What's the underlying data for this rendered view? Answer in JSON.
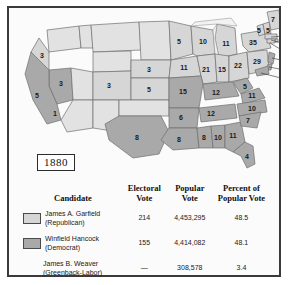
{
  "figure": {
    "year_label": "1880",
    "title_hidden": ""
  },
  "map": {
    "name": "united-states-electoral-map-1880",
    "colors": {
      "republican": "#d6d6d6",
      "democrat": "#a9a9a9",
      "territory": "#e2e2e2",
      "border": "#6f6f6f"
    },
    "states": [
      {
        "name": "oregon",
        "votes": "3",
        "party": "rep"
      },
      {
        "name": "nevada",
        "votes": "3",
        "party": "dem"
      },
      {
        "name": "california",
        "votes": "5",
        "party": "dem"
      },
      {
        "name": "california-rep",
        "votes": "1",
        "party": "rep"
      },
      {
        "name": "colorado",
        "votes": "3",
        "party": "rep"
      },
      {
        "name": "nebraska",
        "votes": "3",
        "party": "rep"
      },
      {
        "name": "kansas",
        "votes": "5",
        "party": "rep"
      },
      {
        "name": "minnesota",
        "votes": "5",
        "party": "rep"
      },
      {
        "name": "iowa",
        "votes": "11",
        "party": "rep"
      },
      {
        "name": "wisconsin",
        "votes": "10",
        "party": "rep"
      },
      {
        "name": "michigan",
        "votes": "11",
        "party": "rep"
      },
      {
        "name": "illinois",
        "votes": "21",
        "party": "rep"
      },
      {
        "name": "indiana",
        "votes": "15",
        "party": "rep"
      },
      {
        "name": "ohio",
        "votes": "22",
        "party": "rep"
      },
      {
        "name": "missouri",
        "votes": "15",
        "party": "dem"
      },
      {
        "name": "arkansas",
        "votes": "6",
        "party": "dem"
      },
      {
        "name": "texas",
        "votes": "8",
        "party": "dem"
      },
      {
        "name": "louisiana",
        "votes": "8",
        "party": "dem"
      },
      {
        "name": "mississippi",
        "votes": "8",
        "party": "dem"
      },
      {
        "name": "alabama",
        "votes": "10",
        "party": "dem"
      },
      {
        "name": "georgia",
        "votes": "11",
        "party": "dem"
      },
      {
        "name": "florida",
        "votes": "4",
        "party": "dem"
      },
      {
        "name": "tennessee",
        "votes": "12",
        "party": "dem"
      },
      {
        "name": "kentucky",
        "votes": "12",
        "party": "dem"
      },
      {
        "name": "west-virginia",
        "votes": "5",
        "party": "dem"
      },
      {
        "name": "virginia",
        "votes": "11",
        "party": "dem"
      },
      {
        "name": "north-carolina",
        "votes": "10",
        "party": "dem"
      },
      {
        "name": "south-carolina",
        "votes": "7",
        "party": "dem"
      },
      {
        "name": "pennsylvania",
        "votes": "29",
        "party": "rep"
      },
      {
        "name": "new-york",
        "votes": "35",
        "party": "rep"
      },
      {
        "name": "vermont",
        "votes": "5",
        "party": "rep"
      },
      {
        "name": "new-hampshire",
        "votes": "5",
        "party": "rep"
      },
      {
        "name": "maine",
        "votes": "7",
        "party": "rep"
      }
    ],
    "leader_labels": [
      {
        "name": "massachusetts",
        "votes": "13",
        "party": "rep"
      },
      {
        "name": "rhode-island",
        "votes": "4",
        "party": "rep"
      },
      {
        "name": "connecticut",
        "votes": "6",
        "party": "rep"
      },
      {
        "name": "new-jersey",
        "votes": "9",
        "party": "dem"
      },
      {
        "name": "delaware",
        "votes": "3",
        "party": "dem"
      },
      {
        "name": "maryland",
        "votes": "8",
        "party": "dem"
      }
    ]
  },
  "table": {
    "headers": {
      "candidate": "Candidate",
      "electoral_vote": "Electoral\nVote",
      "electoral_vote_l1": "Electoral",
      "electoral_vote_l2": "Vote",
      "popular_vote_l1": "Popular",
      "popular_vote_l2": "Vote",
      "percent_l1": "Percent of",
      "percent_l2": "Popular Vote"
    },
    "rows": [
      {
        "name_line1": "James A. Garfield",
        "name_line2": "(Republican)",
        "electoral_vote": "214",
        "popular_vote": "4,453,295",
        "percent": "48.5",
        "swatch": "republican"
      },
      {
        "name_line1": "Winfield Hancock",
        "name_line2": "(Democrat)",
        "electoral_vote": "155",
        "popular_vote": "4,414,082",
        "percent": "48.1",
        "swatch": "democrat"
      },
      {
        "name_line1": "James B. Weaver",
        "name_line2": "(Greenback-Labor)",
        "electoral_vote": "—",
        "popular_vote": "308,578",
        "percent": "3.4",
        "swatch": "none"
      }
    ]
  }
}
